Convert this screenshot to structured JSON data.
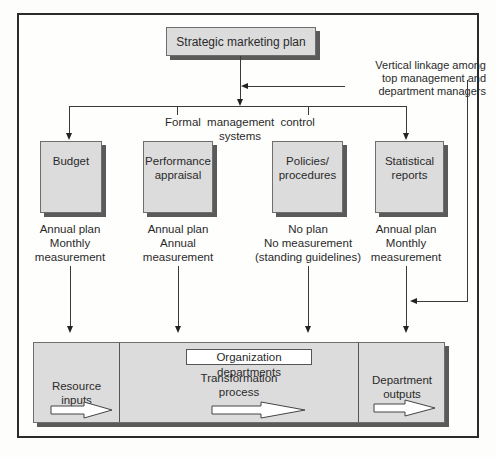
{
  "diagram": {
    "top_box": "Strategic marketing plan",
    "linkage_note": "Vertical linkage among\ntop management and\ndepartment managers",
    "control_systems_label": "Formal management control systems",
    "control_boxes": [
      {
        "label": "Budget",
        "detail": "Annual plan\nMonthly\nmeasurement"
      },
      {
        "label": "Performance\nappraisal",
        "detail": "Annual plan\nAnnual\nmeasurement"
      },
      {
        "label": "Policies/\nprocedures",
        "detail": "No plan\nNo measurement\n(standing guidelines)"
      },
      {
        "label": "Statistical\nreports",
        "detail": "Annual plan\nMonthly\nmeasurement"
      }
    ],
    "organization": {
      "label": "Organization departments",
      "sections": [
        {
          "label": "Resource\ninputs"
        },
        {
          "label": "Transformation\nprocess"
        },
        {
          "label": "Department\noutputs"
        }
      ]
    },
    "colors": {
      "box_fill": "#dcdcdc",
      "shadow": "#5a5a5a",
      "line": "#3a3a3a"
    }
  }
}
